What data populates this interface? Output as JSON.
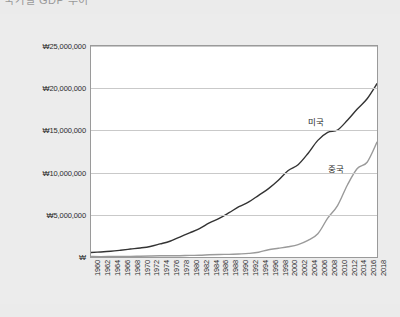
{
  "title": "국가별 GDP 추이",
  "chart_data": {
    "type": "line",
    "title": "국가별 GDP 추이",
    "xlabel": "",
    "ylabel": "",
    "ylim": [
      0,
      25000000
    ],
    "xlim": [
      1960,
      2018
    ],
    "grid": true,
    "legend_position": "inline-right",
    "currency_symbol": "₩",
    "ytick_labels": [
      "₩25,000,000",
      "₩20,000,000",
      "₩15,000,000",
      "₩10,000,000",
      "₩5,000,000",
      "₩"
    ],
    "ytick_values": [
      25000000,
      20000000,
      15000000,
      10000000,
      5000000,
      0
    ],
    "categories": [
      1960,
      1962,
      1964,
      1966,
      1968,
      1970,
      1972,
      1974,
      1976,
      1978,
      1980,
      1982,
      1984,
      1986,
      1988,
      1990,
      1992,
      1994,
      1996,
      1998,
      2000,
      2002,
      2004,
      2006,
      2008,
      2010,
      2012,
      2014,
      2016,
      2018
    ],
    "xtick_labels": [
      "1960",
      "1962",
      "1964",
      "1966",
      "1968",
      "1970",
      "1972",
      "1974",
      "1976",
      "1978",
      "1980",
      "1982",
      "1984",
      "1986",
      "1988",
      "1990",
      "1992",
      "1994",
      "1996",
      "1998",
      "2000",
      "2002",
      "2004",
      "2006",
      "2008",
      "2010",
      "2012",
      "2014",
      "2016",
      "2018"
    ],
    "series": [
      {
        "name": "미국",
        "color": "#333333",
        "label_x": 2004,
        "label_y": 16800000,
        "values": [
          540000,
          600000,
          680000,
          800000,
          940000,
          1070000,
          1250000,
          1550000,
          1870000,
          2360000,
          2860000,
          3350000,
          4040000,
          4580000,
          5250000,
          5960000,
          6520000,
          7310000,
          8100000,
          9090000,
          10250000,
          10940000,
          12270000,
          13820000,
          14770000,
          15050000,
          16200000,
          17530000,
          18750000,
          20540000
        ]
      },
      {
        "name": "중국",
        "color": "#9a9a9a",
        "label_x": 2008,
        "label_y": 11300000,
        "values": [
          59000,
          47000,
          59000,
          76000,
          70000,
          92000,
          113000,
          144000,
          153000,
          150000,
          191000,
          205000,
          260000,
          300000,
          313000,
          361000,
          427000,
          564000,
          864000,
          1030000,
          1210000,
          1470000,
          1960000,
          2750000,
          4600000,
          6090000,
          8530000,
          10480000,
          11230000,
          13610000
        ]
      }
    ]
  }
}
